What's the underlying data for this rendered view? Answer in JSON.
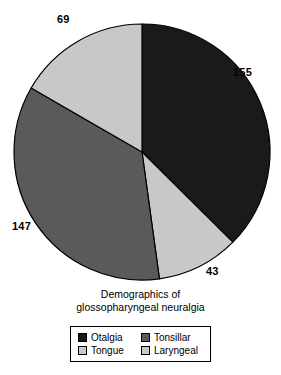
{
  "chart_data": {
    "type": "pie",
    "title": "Demographics of glossopharyngeal neuralgia",
    "title_lines": [
      "Demographics of",
      "glossopharyngeal neuralgia"
    ],
    "categories": [
      "Otalgia",
      "Tongue",
      "Tonsillar",
      "Laryngeal"
    ],
    "values": [
      155,
      43,
      147,
      69
    ],
    "total": 414,
    "labels_shown": [
      "155",
      "43",
      "147",
      "69"
    ],
    "start_angle_deg": 0,
    "direction": "clockwise",
    "legend_position": "bottom",
    "legend_columns": 2,
    "grid": false,
    "slices": [
      {
        "name": "Otalgia",
        "value": 155,
        "label": "155",
        "color": "#1a1a1a",
        "start_deg": 0.0,
        "end_deg": 134.8
      },
      {
        "name": "Tongue",
        "value": 43,
        "label": "43",
        "color": "#c8c8c8",
        "start_deg": 134.8,
        "end_deg": 172.2
      },
      {
        "name": "Tonsillar",
        "value": 147,
        "label": "147",
        "color": "#5a5a5a",
        "start_deg": 172.2,
        "end_deg": 300.0
      },
      {
        "name": "Laryngeal",
        "value": 69,
        "label": "69",
        "color": "#c8c8c8",
        "start_deg": 300.0,
        "end_deg": 360.0
      }
    ]
  },
  "pie": {
    "labels": {
      "otalgia": "155",
      "tongue": "43",
      "tonsillar": "147",
      "laryngeal": "69"
    }
  },
  "title": {
    "line1": "Demographics of",
    "line2": "glossopharyngeal neuralgia"
  },
  "legend": {
    "items": [
      {
        "label": "Otalgia",
        "color": "#1a1a1a"
      },
      {
        "label": "Tonsillar",
        "color": "#5a5a5a"
      },
      {
        "label": "Tongue",
        "color": "#c8c8c8"
      },
      {
        "label": "Laryngeal",
        "color": "#c8c8c8"
      }
    ]
  },
  "colors": {
    "otalgia": "#1a1a1a",
    "tonsillar": "#5a5a5a",
    "tongue": "#c8c8c8",
    "laryngeal": "#c8c8c8",
    "outline": "#000000",
    "background": "#ffffff"
  }
}
